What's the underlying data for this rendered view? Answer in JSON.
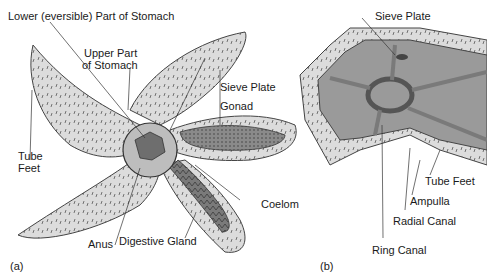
{
  "colors": {
    "skin": "#dcdcdc",
    "spine": "#555555",
    "coelom": "#9a9a9a",
    "organ_dark": "#6e6e6e",
    "canal": "#7a7a7a",
    "label_text": "#1a1a1a",
    "leader_line": "#333333"
  },
  "panel_a": {
    "tag": "(a)",
    "title_implied": "Sea star internal anatomy",
    "labels": {
      "lower_stomach": "Lower (eversible) Part of Stomach",
      "upper_stomach_line1": "Upper Part",
      "upper_stomach_line2": "of Stomach",
      "sieve_plate": "Sieve Plate",
      "gonad": "Gonad",
      "tube_feet_line1": "Tube",
      "tube_feet_line2": "Feet",
      "coelom": "Coelom",
      "anus": "Anus",
      "digestive_gland": "Digestive Gland"
    }
  },
  "panel_b": {
    "tag": "(b)",
    "title_implied": "Water vascular system",
    "labels": {
      "sieve_plate": "Sieve Plate",
      "tube_feet": "Tube Feet",
      "ampulla": "Ampulla",
      "radial_canal": "Radial Canal",
      "ring_canal": "Ring Canal"
    }
  }
}
